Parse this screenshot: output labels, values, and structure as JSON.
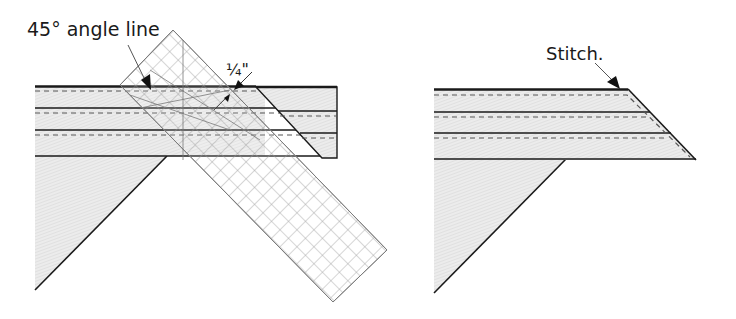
{
  "left_figure": {
    "label_angle": "45° angle line",
    "label_quarter": "¼\"",
    "ruler_grid_color": "#8a8a8a"
  },
  "right_figure": {
    "label_stitch": "Stitch."
  },
  "colors": {
    "fabric_fill": "#e6e6e6",
    "outline": "#1a1a1a",
    "stitch_dash": "#555555",
    "ruler_line": "#8a8a8a"
  }
}
